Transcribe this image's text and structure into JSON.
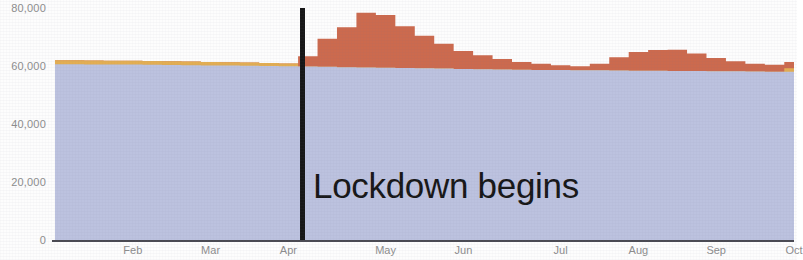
{
  "chart_data": {
    "type": "area",
    "title": "",
    "subtitle": "",
    "xlabel": "",
    "ylabel": "",
    "ylim": [
      0,
      80000
    ],
    "xlim": [
      0,
      38
    ],
    "grid": false,
    "legend_position": "none",
    "y_ticks": [
      {
        "value": 0,
        "label": "0"
      },
      {
        "value": 20000,
        "label": "20,000"
      },
      {
        "value": 40000,
        "label": "40,000"
      },
      {
        "value": 60000,
        "label": "60,000"
      },
      {
        "value": 80000,
        "label": "80,000"
      }
    ],
    "x_ticks": [
      {
        "index": 4,
        "label": "Feb"
      },
      {
        "index": 8,
        "label": "Mar"
      },
      {
        "index": 12,
        "label": "Apr"
      },
      {
        "index": 17,
        "label": "May"
      },
      {
        "index": 21,
        "label": "Jun"
      },
      {
        "index": 26,
        "label": "Jul"
      },
      {
        "index": 30,
        "label": "Aug"
      },
      {
        "index": 34,
        "label": "Sep"
      },
      {
        "index": 38,
        "label": "Oct"
      }
    ],
    "colors": {
      "baseline": "#bcc2df",
      "seasonal": "#e3ae53",
      "excess": "#cc6a4e",
      "annotation_line": "#161616",
      "axis": "#4a4a52",
      "tick_text": "#8d8d8d",
      "background": "#fdfdfd"
    },
    "series": [
      {
        "name": "baseline",
        "color": "#bcc2df",
        "values": [
          60600,
          60600,
          60550,
          60500,
          60500,
          60400,
          60350,
          60300,
          60200,
          60150,
          60100,
          60000,
          59900,
          59800,
          59700,
          59600,
          59500,
          59400,
          59300,
          59200,
          59100,
          59000,
          58900,
          58800,
          58700,
          58650,
          58600,
          58550,
          58500,
          58450,
          58400,
          58350,
          58300,
          58250,
          58200,
          58150,
          58100,
          58050,
          58000
        ]
      },
      {
        "name": "seasonal",
        "color": "#e3ae53",
        "values": [
          1400,
          1400,
          1350,
          1350,
          1300,
          1300,
          1250,
          1250,
          1200,
          1150,
          1100,
          1050,
          1000,
          0,
          0,
          0,
          0,
          0,
          0,
          0,
          0,
          0,
          0,
          0,
          0,
          0,
          0,
          0,
          0,
          0,
          0,
          0,
          0,
          0,
          0,
          0,
          0,
          0,
          1200
        ]
      },
      {
        "name": "excess",
        "color": "#cc6a4e",
        "values": [
          0,
          0,
          0,
          0,
          0,
          0,
          0,
          0,
          0,
          0,
          0,
          0,
          0,
          3600,
          9700,
          13800,
          18900,
          18200,
          14400,
          11200,
          8600,
          6200,
          4800,
          3600,
          2700,
          2100,
          1700,
          1400,
          2300,
          4600,
          6400,
          7200,
          7300,
          6100,
          4600,
          3500,
          2700,
          2400,
          2200
        ]
      }
    ],
    "annotations": [
      {
        "name": "lockdown",
        "text": "Lockdown begins",
        "x_index": 12.7
      }
    ]
  }
}
